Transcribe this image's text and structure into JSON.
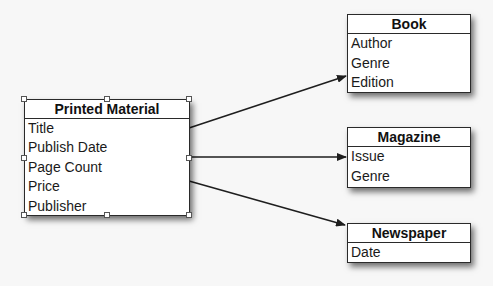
{
  "diagram": {
    "type": "class-inheritance",
    "entities": {
      "printed_material": {
        "title": "Printed Material",
        "attributes": [
          "Title",
          "Publish Date",
          "Page Count",
          "Price",
          "Publisher"
        ],
        "selected": true
      },
      "book": {
        "title": "Book",
        "attributes": [
          "Author",
          "Genre",
          "Edition"
        ]
      },
      "magazine": {
        "title": "Magazine",
        "attributes": [
          "Issue",
          "Genre"
        ]
      },
      "newspaper": {
        "title": "Newspaper",
        "attributes": [
          "Date"
        ]
      }
    },
    "edges": [
      {
        "from": "printed_material",
        "to": "book",
        "style": "arrow"
      },
      {
        "from": "printed_material",
        "to": "magazine",
        "style": "arrow"
      },
      {
        "from": "printed_material",
        "to": "newspaper",
        "style": "arrow"
      }
    ],
    "colors": {
      "line": "#1e1e1e",
      "box_fill": "#ffffff",
      "background": "#f7f7f7"
    }
  }
}
